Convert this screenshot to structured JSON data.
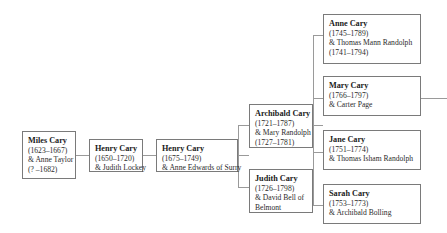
{
  "diagram": {
    "type": "family-tree",
    "line_color": "#9a9a9a",
    "border_color": "#7a7a7a",
    "background_color": "#ffffff"
  },
  "nodes": [
    {
      "id": "miles-cary",
      "name": "Miles Cary",
      "dates": "(1623–1667)",
      "spouse": "& Anne Taylor",
      "spouse_dates": "(? –1682)",
      "generation": 1
    },
    {
      "id": "henry-cary-1",
      "name": "Henry Cary",
      "dates": "(1650–1720)",
      "spouse": "& Judith Lockey",
      "spouse_dates": "",
      "generation": 2
    },
    {
      "id": "henry-cary-2",
      "name": "Henry Cary",
      "dates": "(1675–1749)",
      "spouse": "& Anne Edwards of Surry",
      "spouse_dates": "",
      "generation": 3
    },
    {
      "id": "archibald-cary",
      "name": "Archibald Cary",
      "dates": "(1721–1787)",
      "spouse": "& Mary Randolph",
      "spouse_dates": "(1727–1781)",
      "generation": 4
    },
    {
      "id": "judith-cary",
      "name": "Judith Cary",
      "dates": "(1726–1798)",
      "spouse": "& David Bell of",
      "spouse_dates": "Belmont",
      "generation": 4
    },
    {
      "id": "anne-cary",
      "name": "Anne Cary",
      "dates": "(1745–1789)",
      "spouse": "& Thomas Mann Randolph",
      "spouse_dates": "(1741–1794)",
      "generation": 5
    },
    {
      "id": "mary-cary",
      "name": "Mary Cary",
      "dates": "(1766–1797)",
      "spouse": "& Carter Page",
      "spouse_dates": "",
      "generation": 5
    },
    {
      "id": "jane-cary",
      "name": "Jane Cary",
      "dates": "(1751–1774)",
      "spouse": "& Thomas Isham Randolph",
      "spouse_dates": "",
      "generation": 5
    },
    {
      "id": "sarah-cary",
      "name": "Sarah Cary",
      "dates": "(1753–1773)",
      "spouse": "& Archibald Bolling",
      "spouse_dates": "",
      "generation": 5
    }
  ]
}
